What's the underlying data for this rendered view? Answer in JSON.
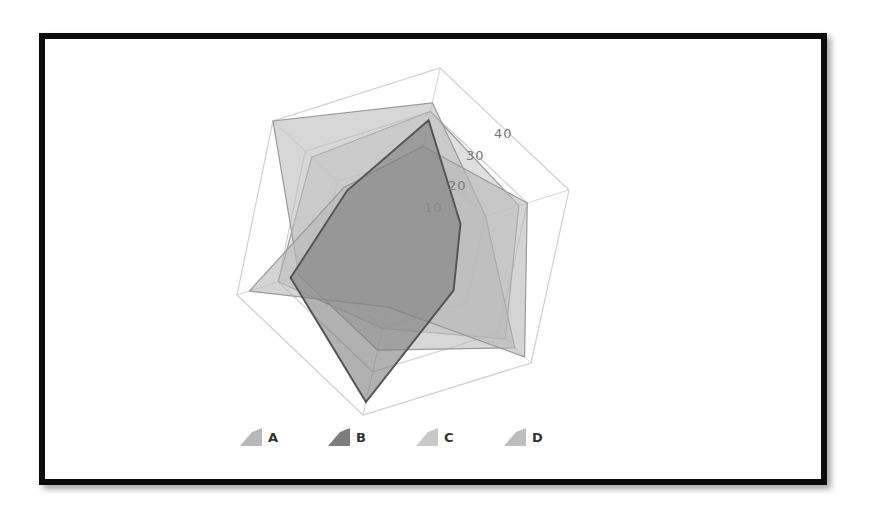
{
  "chart_data": {
    "type": "radar",
    "title": "",
    "axes": [
      "",
      "",
      "",
      "",
      "",
      ""
    ],
    "radial_ticks": [
      "10",
      "20",
      "30",
      "40"
    ],
    "rlim": [
      0,
      40
    ],
    "grid": true,
    "legend_position": "bottom",
    "series": [
      {
        "name": "A",
        "color": "#b8b8b8",
        "values": [
          22,
          30,
          38,
          15,
          37,
          18
        ]
      },
      {
        "name": "B",
        "color": "#7d7d7d",
        "values": [
          28,
          14,
          16,
          37,
          27,
          17
        ]
      },
      {
        "name": "C",
        "color": "#c9c9c9",
        "values": [
          30,
          28,
          32,
          20,
          30,
          28
        ]
      },
      {
        "name": "D",
        "color": "#bdbdbd",
        "values": [
          32,
          20,
          35,
          25,
          25,
          40
        ]
      }
    ]
  },
  "legend": {
    "items": [
      {
        "label": "A",
        "color": "#b8b8b8"
      },
      {
        "label": "B",
        "color": "#7d7d7d"
      },
      {
        "label": "C",
        "color": "#c9c9c9"
      },
      {
        "label": "D",
        "color": "#bdbdbd"
      }
    ]
  }
}
